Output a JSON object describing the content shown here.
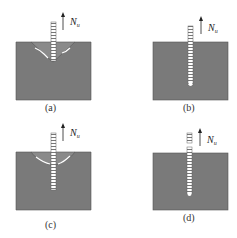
{
  "figure": {
    "panels": [
      {
        "id": "a",
        "caption": "(a)",
        "force_label": "N",
        "force_subscript": "u",
        "failure_mode": "concrete cone breakout"
      },
      {
        "id": "b",
        "caption": "(b)",
        "force_label": "N",
        "force_subscript": "u",
        "failure_mode": "pull-out"
      },
      {
        "id": "c",
        "caption": "(c)",
        "force_label": "N",
        "force_subscript": "u",
        "failure_mode": "combined cone and pull-out"
      },
      {
        "id": "d",
        "caption": "(d)",
        "force_label": "N",
        "force_subscript": "u",
        "failure_mode": "bar rupture"
      }
    ],
    "colors": {
      "concrete": "#7a7a7a",
      "outline": "#555555",
      "bar": "#ffffff",
      "arrow": "#222222"
    }
  }
}
